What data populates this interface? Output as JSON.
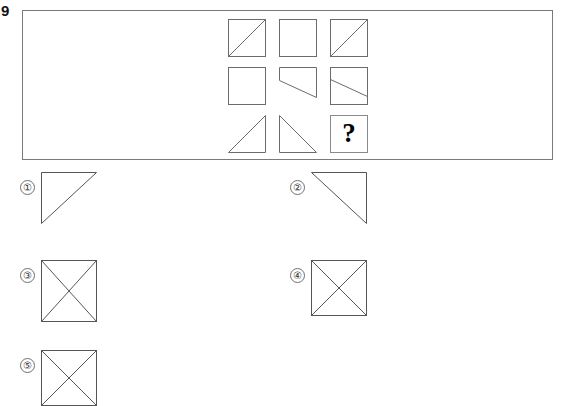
{
  "question": {
    "number": "9",
    "prompt_symbol": "?"
  },
  "matrix": {
    "rows": 3,
    "columns": 3,
    "cells": [
      {
        "position": "r1c1",
        "shape": "square-with-diagonal-bottomleft-to-topright"
      },
      {
        "position": "r1c2",
        "shape": "plain-square"
      },
      {
        "position": "r1c3",
        "shape": "square-with-diagonal-bottomleft-to-topright"
      },
      {
        "position": "r2c1",
        "shape": "plain-square"
      },
      {
        "position": "r2c2",
        "shape": "trapezoid-slanted-bottom-edge"
      },
      {
        "position": "r2c3",
        "shape": "square-with-shallow-slanted-line"
      },
      {
        "position": "r3c1",
        "shape": "right-triangle-right-angle-bottom-right"
      },
      {
        "position": "r3c2",
        "shape": "right-triangle-right-angle-bottom-left"
      },
      {
        "position": "r3c3",
        "shape": "question-mark-box"
      }
    ]
  },
  "options": [
    {
      "id": "1",
      "label": "①",
      "shape": "right-triangle-right-angle-top-left"
    },
    {
      "id": "2",
      "label": "②",
      "shape": "right-triangle-right-angle-top-right"
    },
    {
      "id": "3",
      "label": "③",
      "shape": "tall-square-with-both-diagonals"
    },
    {
      "id": "4",
      "label": "④",
      "shape": "square-with-both-diagonals"
    },
    {
      "id": "5",
      "label": "⑤",
      "shape": "square-with-both-diagonals-clipped"
    }
  ],
  "colors": {
    "stroke": "#6b6b6b",
    "panel_border": "#7a7a7a",
    "text": "#000000",
    "background": "#ffffff"
  }
}
